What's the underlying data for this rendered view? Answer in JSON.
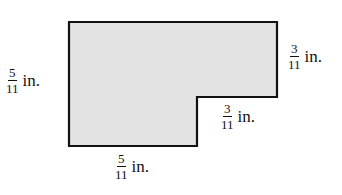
{
  "diagram": {
    "type": "composite-rectangle-L-shape",
    "fill_color": "#e3e3e3",
    "stroke_color": "#111111",
    "vertices": [
      [
        69,
        22
      ],
      [
        277,
        22
      ],
      [
        277,
        97
      ],
      [
        197,
        97
      ],
      [
        197,
        146
      ],
      [
        69,
        146
      ]
    ],
    "labels": {
      "left": {
        "numerator": "5",
        "denominator": "11",
        "unit": "in."
      },
      "right": {
        "numerator": "3",
        "denominator": "11",
        "unit": "in."
      },
      "step": {
        "numerator": "3",
        "denominator": "11",
        "unit": "in."
      },
      "bottom": {
        "numerator": "5",
        "denominator": "11",
        "unit": "in."
      }
    }
  }
}
